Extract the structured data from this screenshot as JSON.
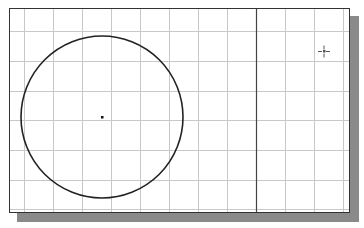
{
  "canvas": {
    "background": "#ffffff",
    "grid_color": "#c8c8c8",
    "line_color": "#222222",
    "grid": {
      "vertical_x": [
        14,
        43,
        72,
        101,
        130,
        159,
        188,
        217,
        275,
        304,
        333
      ],
      "horizontal_y": [
        22,
        52,
        82,
        111,
        141,
        171,
        200
      ]
    },
    "vertical_line": {
      "x": 246
    },
    "circle": {
      "cx": 92,
      "cy": 108,
      "r": 81
    },
    "center_point": {
      "x": 92,
      "y": 108
    },
    "cursor": {
      "x": 314,
      "y": 42,
      "icon": "crosshair-cursor-icon"
    }
  }
}
